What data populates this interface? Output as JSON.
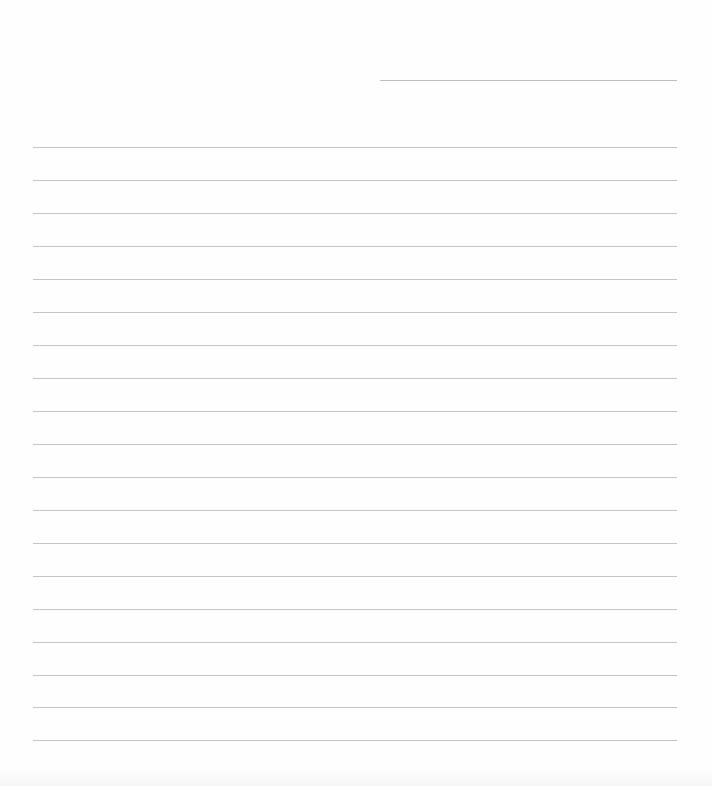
{
  "document": {
    "type": "lined-paper",
    "background_color": "#fefefe",
    "line_color": "#c4c4c4",
    "header_line": {
      "x": 380,
      "y": 80,
      "width": 297
    },
    "rules": {
      "x": 33,
      "width": 644,
      "y_positions": [
        147,
        180,
        213,
        246,
        279,
        312,
        345,
        378,
        411,
        444,
        477,
        510,
        543,
        576,
        609,
        642,
        675,
        707,
        740
      ]
    }
  }
}
